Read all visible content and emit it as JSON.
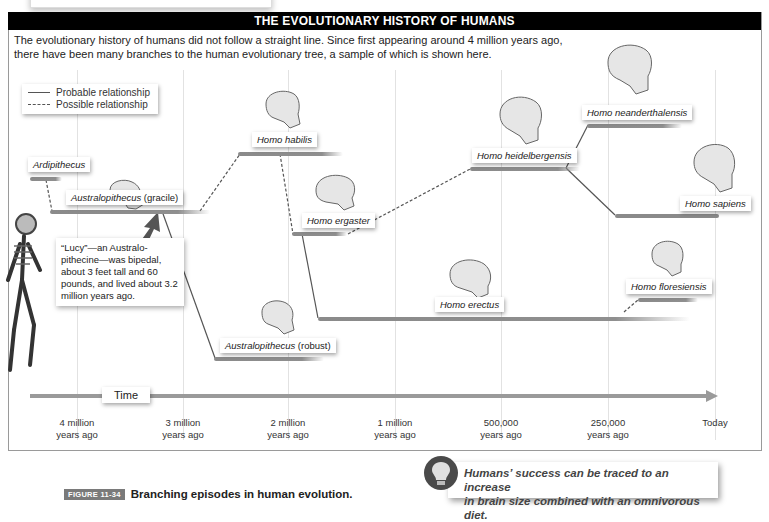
{
  "header": {
    "title": "THE EVOLUTIONARY HISTORY OF HUMANS",
    "intro_line1": "The evolutionary history of humans did not follow a straight line. Since first appearing around 4 million years ago,",
    "intro_line2": "there have been many branches to the human evolutionary tree, a sample of which is shown here."
  },
  "legend": {
    "probable": "Probable relationship",
    "possible": "Possible relationship"
  },
  "species": {
    "ardipithecus": {
      "name": "Ardipithecus",
      "suffix": ""
    },
    "australopithecus_gracile": {
      "name": "Australopithecus",
      "suffix": " (gracile)"
    },
    "homo_habilis": {
      "name": "Homo habilis",
      "suffix": ""
    },
    "homo_ergaster": {
      "name": "Homo ergaster",
      "suffix": ""
    },
    "australopithecus_robust": {
      "name": "Australopithecus",
      "suffix": " (robust)"
    },
    "homo_erectus": {
      "name": "Homo erectus",
      "suffix": ""
    },
    "homo_heidelbergensis": {
      "name": "Homo heidelbergensis",
      "suffix": ""
    },
    "homo_neanderthalensis": {
      "name": "Homo neanderthalensis",
      "suffix": ""
    },
    "homo_sapiens": {
      "name": "Homo sapiens",
      "suffix": ""
    },
    "homo_floresiensis": {
      "name": "Homo floresiensis",
      "suffix": ""
    }
  },
  "lucy_note": "“Lucy”—an Australo-pithecine—was bipedal, about 3 feet tall and 60 pounds, and lived about 3.2 million years ago.",
  "timeline": {
    "label": "Time",
    "ticks": [
      {
        "line1": "4 million",
        "line2": "years ago"
      },
      {
        "line1": "3 million",
        "line2": "years ago"
      },
      {
        "line1": "2 million",
        "line2": "years ago"
      },
      {
        "line1": "1 million",
        "line2": "years ago"
      },
      {
        "line1": "500,000",
        "line2": "years ago"
      },
      {
        "line1": "250,000",
        "line2": "years ago"
      },
      {
        "line1": "Today",
        "line2": ""
      }
    ]
  },
  "caption": {
    "figure_tag": "FIGURE 11-34",
    "text": "Branching episodes in human evolution."
  },
  "tip": {
    "icon": "lightbulb-icon",
    "line1": "Humans’ success can be traced to an increase",
    "line2": "in brain size combined with an omnivorous diet."
  },
  "colors": {
    "header_bg": "#000000",
    "bar": "#8a8a8a",
    "gridline": "#e2e2e2",
    "skull": "#e6e6e6"
  }
}
